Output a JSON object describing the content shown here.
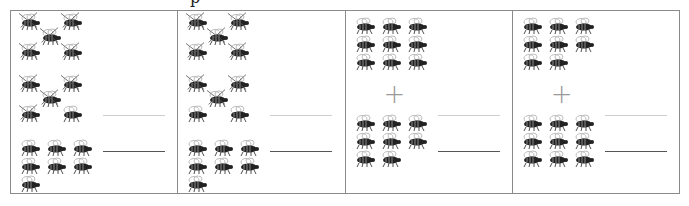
{
  "title_fragment": "p",
  "colors": {
    "border": "#8a8a8a",
    "bee_dark": "#222222",
    "bee_wing": "#bdbdbd",
    "plus": "#9a9a9a",
    "answer_line": "#555555",
    "hint_line": "#cfcfcf"
  },
  "plus_symbol": "+",
  "panels": [
    {
      "type": "subtraction",
      "total_top": 10,
      "crossed": 9,
      "bottom_count": 7
    },
    {
      "type": "subtraction",
      "total_top": 10,
      "crossed": 8,
      "bottom_count": 7
    },
    {
      "type": "addition",
      "top_count": 9,
      "bottom_count": 8
    },
    {
      "type": "addition",
      "top_count": 8,
      "bottom_count": 9
    }
  ]
}
